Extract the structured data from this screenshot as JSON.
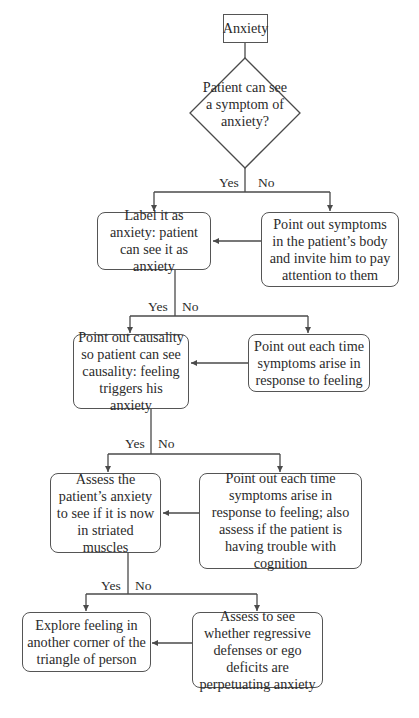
{
  "flowchart": {
    "start": {
      "label": "Anxiety"
    },
    "decision": {
      "label": "Patient can see a symptom of anxiety?"
    },
    "branch_labels": {
      "yes": "Yes",
      "no": "No"
    },
    "levels": [
      {
        "yes_node": "Label it as anxiety: patient can see it as anxiety",
        "no_node": "Point out symptoms in the patient’s body and invite him to pay attention to them"
      },
      {
        "yes_node": "Point out causality so patient can see causality: feeling triggers his anxiety",
        "no_node": "Point out each time symptoms arise in response to feeling"
      },
      {
        "yes_node": "Assess the patient’s anxiety to see if it is now in striated muscles",
        "no_node": "Point out each time symptoms arise in response to feeling; also assess if the patient is having trouble with cognition"
      },
      {
        "yes_node": "Explore feeling in another corner of the triangle of person",
        "no_node": "Assess to see whether regressive defenses or ego deficits are perpetuating anxiety"
      }
    ]
  },
  "colors": {
    "line": "#4a4a4a",
    "text": "#2b2b2b",
    "background": "#ffffff"
  }
}
